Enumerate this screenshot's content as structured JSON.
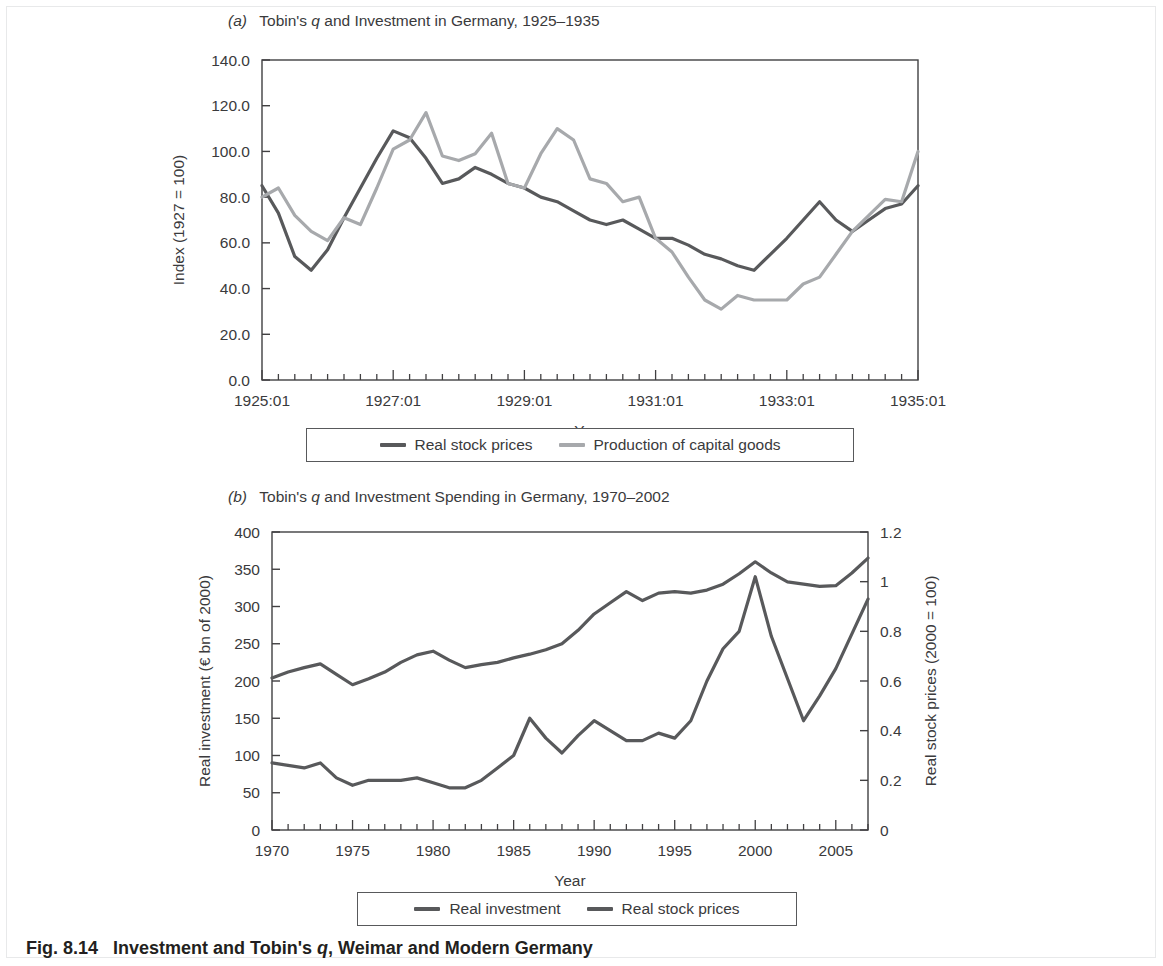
{
  "figure": {
    "caption_number": "Fig. 8.14",
    "caption_text": "Investment and Tobin's q, Weimar and Modern Germany",
    "background": "#ffffff"
  },
  "colors": {
    "dark_line": "#58595b",
    "light_line": "#a7a9ac",
    "axis": "#414042",
    "text": "#3a3a3c"
  },
  "panel_a": {
    "label": "(a)",
    "title": "Tobin's q and Investment in Germany, 1925–1935",
    "legend": [
      {
        "label": "Real stock prices",
        "color": "#58595b"
      },
      {
        "label": "Production of capital goods",
        "color": "#a7a9ac"
      }
    ]
  },
  "panel_b": {
    "label": "(b)",
    "title": "Tobin's q and Investment Spending in Germany, 1970–2002",
    "legend": [
      {
        "label": "Real investment",
        "color": "#58595b"
      },
      {
        "label": "Real stock prices",
        "color": "#58595b"
      }
    ]
  },
  "chart_data": [
    {
      "type": "line",
      "id": "panel-a",
      "title": "Tobin's q and Investment in Germany, 1925–1935",
      "xlabel": "Year",
      "ylabel": "Index (1927 = 100)",
      "ylim": [
        0.0,
        140.0
      ],
      "yticks": [
        "0.0",
        "20.0",
        "40.0",
        "60.0",
        "80.0",
        "100.0",
        "120.0",
        "140.0"
      ],
      "ytick_values": [
        0,
        20,
        40,
        60,
        80,
        100,
        120,
        140
      ],
      "xlim": [
        1925.0,
        1935.0
      ],
      "xticks": [
        "1925:01",
        "1927:01",
        "1929:01",
        "1931:01",
        "1933:01",
        "1935:01"
      ],
      "xtick_values": [
        1925,
        1927,
        1929,
        1931,
        1933,
        1935
      ],
      "minor_tick_step": 0.25,
      "grid": false,
      "legend_position": "below",
      "x": [
        1925.0,
        1925.25,
        1925.5,
        1925.75,
        1926.0,
        1926.25,
        1926.5,
        1926.75,
        1927.0,
        1927.25,
        1927.5,
        1927.75,
        1928.0,
        1928.25,
        1928.5,
        1928.75,
        1929.0,
        1929.25,
        1929.5,
        1929.75,
        1930.0,
        1930.25,
        1930.5,
        1930.75,
        1931.0,
        1931.25,
        1931.5,
        1931.75,
        1932.0,
        1932.25,
        1932.5,
        1932.75,
        1933.0,
        1933.25,
        1933.5,
        1933.75,
        1934.0,
        1934.25,
        1934.5,
        1934.75,
        1935.0
      ],
      "series": [
        {
          "name": "Real stock prices",
          "color": "#58595b",
          "values": [
            85,
            73,
            54,
            48,
            57,
            71,
            84,
            97,
            109,
            106,
            97,
            86,
            88,
            93,
            90,
            86,
            84,
            80,
            78,
            74,
            70,
            68,
            70,
            66,
            62,
            62,
            59,
            55,
            53,
            50,
            48,
            55,
            62,
            70,
            78,
            70,
            65,
            70,
            75,
            77,
            85
          ]
        },
        {
          "name": "Production of capital goods",
          "color": "#a7a9ac",
          "values": [
            80,
            84,
            72,
            65,
            61,
            71,
            68,
            84,
            101,
            105,
            117,
            98,
            96,
            99,
            108,
            86,
            84,
            99,
            110,
            105,
            88,
            86,
            78,
            80,
            62,
            56,
            45,
            35,
            31,
            37,
            35,
            35,
            35,
            42,
            45,
            55,
            65,
            72,
            79,
            78,
            100
          ]
        }
      ]
    },
    {
      "type": "line",
      "id": "panel-b",
      "title": "Tobin's q and Investment Spending in Germany, 1970–2002",
      "xlabel": "Year",
      "ylabel_left": "Real investment (€ bn of 2000)",
      "ylabel_right": "Real stock prices (2000 = 100)",
      "ylim_left": [
        0,
        400
      ],
      "yticks_left": [
        "0",
        "50",
        "100",
        "150",
        "200",
        "250",
        "300",
        "350",
        "400"
      ],
      "ytick_values_left": [
        0,
        50,
        100,
        150,
        200,
        250,
        300,
        350,
        400
      ],
      "ylim_right": [
        0,
        1.2
      ],
      "yticks_right": [
        "0",
        "0.2",
        "0.4",
        "0.6",
        "0.8",
        "1",
        "1.2"
      ],
      "ytick_values_right": [
        0,
        0.2,
        0.4,
        0.6,
        0.8,
        1.0,
        1.2
      ],
      "xlim": [
        1970,
        2007
      ],
      "xticks": [
        "1970",
        "1975",
        "1980",
        "1985",
        "1990",
        "1995",
        "2000",
        "2005"
      ],
      "xtick_values": [
        1970,
        1975,
        1980,
        1985,
        1990,
        1995,
        2000,
        2005
      ],
      "minor_tick_step": 1,
      "grid": false,
      "legend_position": "below",
      "x": [
        1970,
        1971,
        1972,
        1973,
        1974,
        1975,
        1976,
        1977,
        1978,
        1979,
        1980,
        1981,
        1982,
        1983,
        1984,
        1985,
        1986,
        1987,
        1988,
        1989,
        1990,
        1991,
        1992,
        1993,
        1994,
        1995,
        1996,
        1997,
        1998,
        1999,
        2000,
        2001,
        2002,
        2003,
        2004,
        2005,
        2006,
        2007
      ],
      "series": [
        {
          "name": "Real investment",
          "axis": "left",
          "color": "#58595b",
          "values": [
            204,
            212,
            218,
            223,
            209,
            195,
            203,
            212,
            225,
            235,
            240,
            228,
            218,
            222,
            225,
            231,
            236,
            242,
            250,
            268,
            290,
            305,
            320,
            308,
            318,
            320,
            318,
            322,
            330,
            344,
            360,
            345,
            333,
            330,
            327,
            328,
            345,
            365
          ]
        },
        {
          "name": "Real stock prices",
          "axis": "right",
          "color": "#58595b",
          "values": [
            0.27,
            0.26,
            0.25,
            0.27,
            0.21,
            0.18,
            0.2,
            0.2,
            0.2,
            0.21,
            0.19,
            0.17,
            0.17,
            0.2,
            0.25,
            0.3,
            0.45,
            0.37,
            0.31,
            0.38,
            0.44,
            0.4,
            0.36,
            0.36,
            0.39,
            0.37,
            0.44,
            0.6,
            0.73,
            0.8,
            1.02,
            0.78,
            0.61,
            0.44,
            0.54,
            0.65,
            0.79,
            0.93
          ]
        }
      ]
    }
  ]
}
